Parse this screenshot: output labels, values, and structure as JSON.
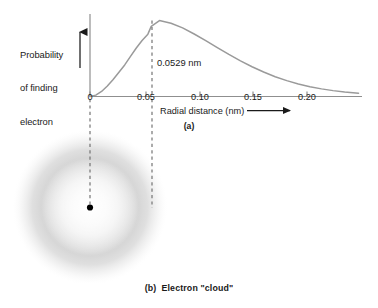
{
  "figure": {
    "background_color": "#ffffff",
    "ink_color": "#1a1a1a",
    "curve_color": "#9a9a9a",
    "axis_color": "#8f8f8f",
    "dash_color": "#6e6e6e",
    "cloud_color": "#c9c9c9"
  },
  "panel_a": {
    "caption": "(a)",
    "y_axis_label_line1": "Probability",
    "y_axis_label_line2": "of finding",
    "y_axis_label_line3": "electron",
    "y_axis_arrow_icon": "up-arrow-icon",
    "x_axis_label": "Radial distance (nm)",
    "x_axis_arrow_icon": "right-arrow-icon",
    "peak_annotation": "0.0529 nm",
    "tick_labels": [
      "0",
      "0.05",
      "0.10",
      "0.15",
      "0.20"
    ]
  },
  "panel_b": {
    "caption": "(b)  Electron \"cloud\"",
    "nucleus_icon": "nucleus-dot-icon",
    "cloud_icon": "electron-cloud-icon"
  },
  "chart_data": {
    "type": "line",
    "title": "",
    "subtitle": "",
    "xlabel": "Radial distance (nm)",
    "ylabel": "Probability of finding electron",
    "xlim": [
      0,
      0.235
    ],
    "ylim": [
      0,
      1.05
    ],
    "grid": false,
    "legend": "none",
    "xticks": [
      0,
      0.05,
      0.1,
      0.15,
      0.2
    ],
    "xticklabels": [
      "0",
      "0.05",
      "0.10",
      "0.15",
      "0.20"
    ],
    "yticks": [],
    "yticklabels": [],
    "annotations": [
      {
        "text": "0.0529 nm",
        "x": 0.0529,
        "y": 0.5,
        "type": "vertical-dashed-line-at-peak"
      }
    ],
    "series": [
      {
        "name": "Radial probability density (1s hydrogen)",
        "x": [
          0.0,
          0.005,
          0.01,
          0.015,
          0.02,
          0.025,
          0.03,
          0.035,
          0.04,
          0.045,
          0.05,
          0.0529,
          0.06,
          0.07,
          0.08,
          0.09,
          0.1,
          0.11,
          0.12,
          0.13,
          0.14,
          0.15,
          0.16,
          0.17,
          0.18,
          0.19,
          0.2,
          0.21,
          0.22,
          0.232
        ],
        "y": [
          0.0,
          0.018,
          0.066,
          0.137,
          0.224,
          0.319,
          0.414,
          0.527,
          0.637,
          0.736,
          0.818,
          0.92,
          0.997,
          0.962,
          0.9,
          0.82,
          0.732,
          0.641,
          0.552,
          0.468,
          0.391,
          0.321,
          0.26,
          0.208,
          0.165,
          0.129,
          0.1,
          0.077,
          0.059,
          0.043
        ]
      }
    ],
    "peak": {
      "x": 0.0529,
      "y": 1.0,
      "label": "0.0529 nm"
    }
  }
}
